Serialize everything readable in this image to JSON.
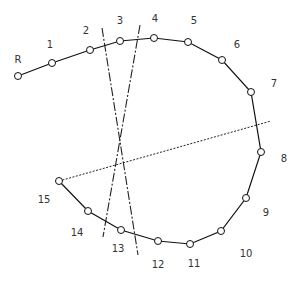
{
  "diagram": {
    "type": "polyline-with-reference-lines",
    "points": [
      {
        "label": "R"
      },
      {
        "label": "1"
      },
      {
        "label": "2"
      },
      {
        "label": "3"
      },
      {
        "label": "4"
      },
      {
        "label": "5"
      },
      {
        "label": "6"
      },
      {
        "label": "7"
      },
      {
        "label": "8"
      },
      {
        "label": "9"
      },
      {
        "label": "10"
      },
      {
        "label": "11"
      },
      {
        "label": "12"
      },
      {
        "label": "13"
      },
      {
        "label": "14"
      },
      {
        "label": "15"
      }
    ],
    "reference_lines": [
      {
        "name": "dash-dot-line-a",
        "style": "dash-dot",
        "from_near": "2",
        "to_near": "12"
      },
      {
        "name": "dash-dot-line-b",
        "style": "dash-dot",
        "from_near": "4",
        "to_near": "13"
      },
      {
        "name": "dotted-line",
        "style": "dotted",
        "from_near": "15",
        "to_near": "7-8"
      }
    ],
    "colors": {
      "stroke": "#111111",
      "label": "#333333",
      "background": "#ffffff"
    }
  }
}
